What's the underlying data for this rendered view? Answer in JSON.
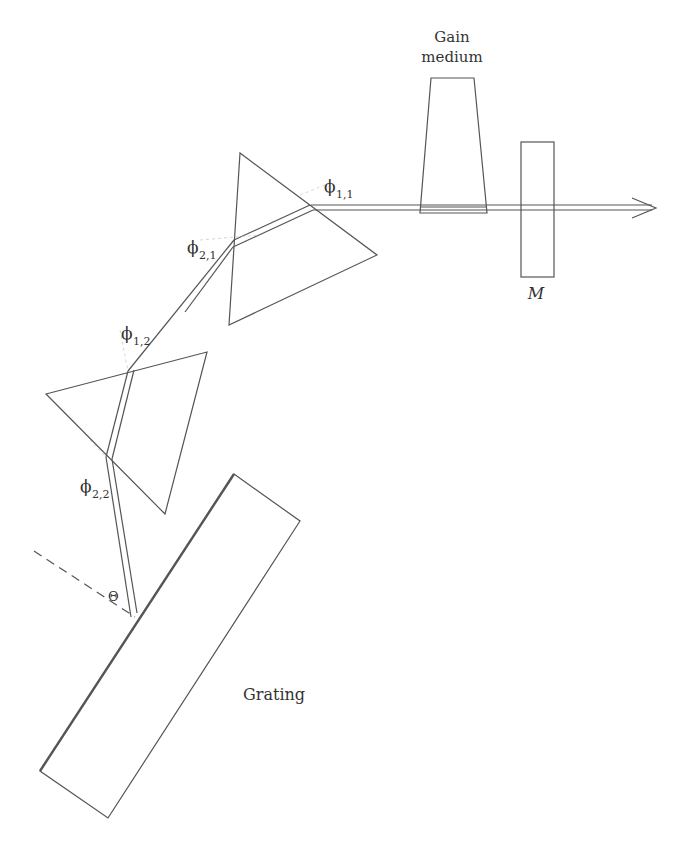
{
  "diagram": {
    "labels": {
      "gain_medium_line1": "Gain",
      "gain_medium_line2": "medium",
      "mirror": "M",
      "grating": "Grating",
      "theta": "Θ",
      "phi": "ϕ",
      "phi_1_1_sub": "1,1",
      "phi_2_1_sub": "2,1",
      "phi_1_2_sub": "1,2",
      "phi_2_2_sub": "2,2"
    },
    "components": [
      {
        "name": "gain-medium",
        "shape": "trapezoid"
      },
      {
        "name": "output-mirror",
        "shape": "rectangle",
        "label": "M"
      },
      {
        "name": "prism-1",
        "shape": "triangle"
      },
      {
        "name": "prism-2",
        "shape": "triangle"
      },
      {
        "name": "grating",
        "shape": "rectangle",
        "label": "Grating"
      }
    ],
    "colors": {
      "line": "#555555",
      "text": "#333333",
      "background": "#ffffff"
    }
  }
}
